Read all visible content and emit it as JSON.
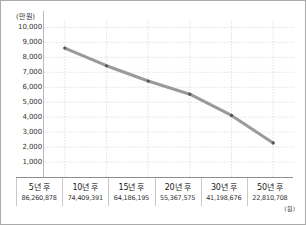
{
  "chart": {
    "type": "line",
    "unit_top_label": "(만 원)",
    "unit_bottom_label": "(원)"
  },
  "chart_data": {
    "type": "line",
    "title": "",
    "xlabel": "",
    "ylabel": "(만 원)",
    "unit_note": "(원)",
    "categories": [
      "5년 후",
      "10년 후",
      "15년 후",
      "20년 후",
      "30년 후",
      "50년 후"
    ],
    "tick_labels": [
      "10,000",
      "9,000",
      "8,000",
      "7,000",
      "6,000",
      "5,000",
      "4,000",
      "3,000",
      "2,000",
      "1,000"
    ],
    "ylim": [
      0,
      10500
    ],
    "ytick_step": 1000,
    "grid": true,
    "legend": "none",
    "series": [
      {
        "name": "금액",
        "values": [
          8626,
          7441,
          6419,
          5537,
          4120,
          2281
        ],
        "point_labels": [
          "86,260,878",
          "74,409,391",
          "64,186,195",
          "55,367,575",
          "41,198,676",
          "22,810,708"
        ],
        "color": "#9a9a9a"
      }
    ]
  },
  "yticks": [
    {
      "label": "10,000",
      "value": 10000
    },
    {
      "label": "9,000",
      "value": 9000
    },
    {
      "label": "8,000",
      "value": 8000
    },
    {
      "label": "7,000",
      "value": 7000
    },
    {
      "label": "6,000",
      "value": 6000
    },
    {
      "label": "5,000",
      "value": 5000
    },
    {
      "label": "4,000",
      "value": 4000
    },
    {
      "label": "3,000",
      "value": 3000
    },
    {
      "label": "2,000",
      "value": 2000
    },
    {
      "label": "1,000",
      "value": 1000
    }
  ],
  "xcategories": [
    {
      "name": "5년 후",
      "value": "86,260,878"
    },
    {
      "name": "10년 후",
      "value": "74,409,391"
    },
    {
      "name": "15년 후",
      "value": "64,186,195"
    },
    {
      "name": "20년 후",
      "value": "55,367,575"
    },
    {
      "name": "30년 후",
      "value": "41,198,676"
    },
    {
      "name": "50년 후",
      "value": "22,810,708"
    }
  ],
  "colors": {
    "line": "#9a9a9a",
    "marker": "#555555",
    "grid": "#d6d6d6",
    "axis": "#8d8d8d",
    "border": "#aaaaaa",
    "text": "#1a1a1a"
  }
}
